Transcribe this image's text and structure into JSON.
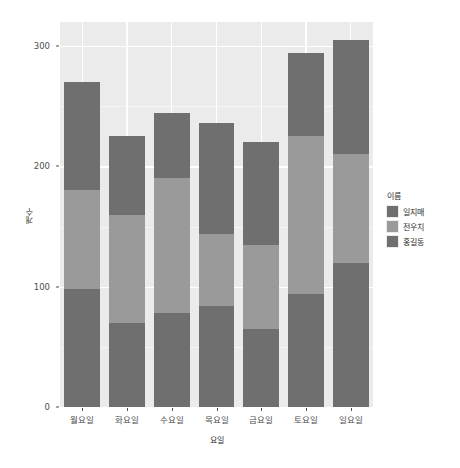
{
  "chart_data": {
    "type": "bar",
    "title": "",
    "subtitle": "",
    "xlabel": "요일",
    "ylabel": "개수",
    "stacked": true,
    "grid": true,
    "legend_position": "right",
    "legend_title": "이름",
    "ylim": [
      0,
      320
    ],
    "yticks": [
      0,
      100,
      200,
      300
    ],
    "ytick_labels": [
      "0",
      "100",
      "200",
      "300"
    ],
    "categories": [
      "월요일",
      "화요일",
      "수요일",
      "목요일",
      "금요일",
      "토요일",
      "일요일"
    ],
    "series": [
      {
        "name": "홍길동",
        "color": "#6f6f6f",
        "values": [
          98,
          70,
          78,
          84,
          65,
          94,
          120
        ]
      },
      {
        "name": "전우치",
        "color": "#9a9a9a",
        "values": [
          82,
          90,
          112,
          60,
          70,
          131,
          90
        ]
      },
      {
        "name": "일지매",
        "color": "#6f6f6f",
        "values": [
          90,
          65,
          54,
          92,
          85,
          69,
          95
        ]
      }
    ],
    "totals": [
      270,
      225,
      244,
      236,
      220,
      294,
      305
    ],
    "stack_order_bottom_to_top": [
      "홍길동",
      "전우치",
      "일지매"
    ],
    "panel_background": "#ebebeb",
    "grid_color": "#ffffff"
  },
  "legend": {
    "title": "이름",
    "items": [
      {
        "label": "일지매",
        "color": "#6f6f6f"
      },
      {
        "label": "전우치",
        "color": "#9a9a9a"
      },
      {
        "label": "홍길동",
        "color": "#6f6f6f"
      }
    ]
  },
  "axes": {
    "y_title": "개수",
    "x_title": "요일"
  }
}
